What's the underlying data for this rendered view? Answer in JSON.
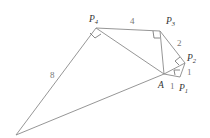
{
  "diagram": {
    "type": "geometry-figure",
    "points": {
      "O": {
        "label": "",
        "x": 16,
        "y": 135
      },
      "P4": {
        "label": "P",
        "sub": "4",
        "x": 96,
        "y": 28
      },
      "P3": {
        "label": "P",
        "sub": "3",
        "x": 160,
        "y": 31
      },
      "P2": {
        "label": "P",
        "sub": "2",
        "x": 185,
        "y": 63
      },
      "P1": {
        "label": "P",
        "sub": "1",
        "x": 180,
        "y": 77
      },
      "A": {
        "label": "A",
        "x": 164,
        "y": 74
      }
    },
    "edge_labels": {
      "P4P3": "4",
      "P3P2": "2",
      "P2P1": "1",
      "AP1": "1",
      "OP4": "8"
    },
    "right_angles": [
      "P4",
      "P3",
      "P2",
      "P1"
    ],
    "colors": {
      "line": "#8a8a8a",
      "text": "#333333",
      "number": "#777777"
    }
  }
}
